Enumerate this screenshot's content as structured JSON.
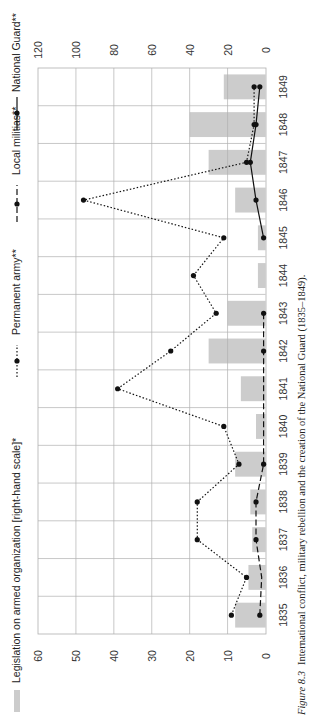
{
  "caption": {
    "figure_label": "Figure 8.3",
    "text": "International conflict, military rebellion and the creation of the National Guard (1835–1849)."
  },
  "legend": [
    {
      "key": "legislation",
      "label": "Legislation on armed organization [right-hand scale]*",
      "style": "bar"
    },
    {
      "key": "army",
      "label": "Permanent army**",
      "style": "dotted"
    },
    {
      "key": "militias",
      "label": "Local militias**",
      "style": "dashed"
    },
    {
      "key": "guard",
      "label": "National Guard**",
      "style": "solid"
    }
  ],
  "colors": {
    "bar": "#cccccc",
    "grid": "#b0b0b0",
    "line": "#111111",
    "text": "#333333"
  },
  "axes": {
    "left_ticks": [
      "60",
      "50",
      "40",
      "30",
      "20",
      "10",
      "0"
    ],
    "right_ticks": [
      "120",
      "100",
      "80",
      "60",
      "40",
      "20",
      "0"
    ]
  },
  "chart_data": {
    "type": "bar+line",
    "orientation": "rotated 90° clockwise (years run bottom-to-top along the page, values increase leftward)",
    "title": "International conflict, military rebellion and the creation of the National Guard (1835–1849)",
    "xlabel": "Year",
    "ylabel_left": "Number (left-hand scale)",
    "ylabel_right": "Legislation on armed organization (right-hand scale)",
    "ylim_left": [
      0,
      60
    ],
    "ylim_right": [
      0,
      120
    ],
    "grid": true,
    "legend_position": "top (left side of page)",
    "categories": [
      "1835",
      "1836",
      "1837",
      "1838",
      "1839",
      "1840",
      "1841",
      "1842",
      "1843",
      "1844",
      "1845",
      "1846",
      "1847",
      "1848",
      "1849"
    ],
    "series": [
      {
        "name": "Legislation on armed organization [right-hand scale]*",
        "type": "bar",
        "axis": "right",
        "values": [
          16,
          9,
          7,
          8,
          16,
          5,
          13,
          30,
          20,
          4,
          4,
          16,
          30,
          40,
          22
        ]
      },
      {
        "name": "Permanent army**",
        "type": "line",
        "style": "dotted",
        "axis": "left",
        "values": [
          9,
          5,
          null,
          18,
          7,
          11,
          39,
          25,
          13,
          19,
          11,
          48,
          5,
          3,
          3
        ]
      },
      {
        "name": "Permanent army** (1837)",
        "type": "note",
        "axis": "left",
        "values": [
          null,
          null,
          18,
          null,
          null,
          null,
          null,
          null,
          null,
          null,
          null,
          null,
          null,
          null,
          null
        ]
      },
      {
        "name": "Local militias**",
        "type": "line",
        "style": "dashed",
        "axis": "left",
        "values": [
          1.5,
          null,
          2.5,
          2.5,
          0.5,
          null,
          null,
          0.5,
          0.5,
          null,
          null,
          null,
          null,
          null,
          null
        ]
      },
      {
        "name": "National Guard**",
        "type": "line",
        "style": "solid",
        "axis": "left",
        "values": [
          null,
          null,
          null,
          null,
          null,
          null,
          null,
          null,
          null,
          null,
          0.5,
          2.5,
          4,
          2.5,
          1.5
        ]
      }
    ],
    "army_full": [
      9,
      5,
      18,
      18,
      7,
      11,
      39,
      25,
      13,
      19,
      11,
      48,
      5,
      3,
      3
    ],
    "militias_full": [
      1.5,
      1.0,
      2.5,
      2.5,
      0.5,
      0.5,
      0.5,
      0.5,
      0.5,
      null,
      null,
      null,
      null,
      null,
      null
    ],
    "militia_markers": [
      1.5,
      null,
      2.5,
      2.5,
      0.5,
      null,
      null,
      0.5,
      0.5,
      null,
      null,
      null,
      null,
      null,
      null
    ],
    "guard_full": [
      null,
      null,
      null,
      null,
      null,
      null,
      null,
      null,
      null,
      null,
      0.5,
      2.5,
      4,
      2.5,
      1.5
    ]
  }
}
